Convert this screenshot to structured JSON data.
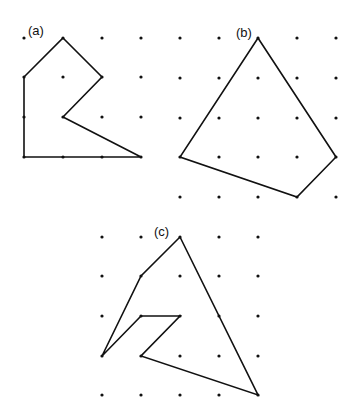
{
  "figures": [
    {
      "label": "(a)",
      "label_pos": [
        28,
        35
      ],
      "grid": {
        "xs": [
          24,
          63,
          102,
          141
        ],
        "ys": [
          38,
          77,
          117,
          157
        ]
      },
      "polygon": [
        [
          63,
          38
        ],
        [
          102,
          77
        ],
        [
          63,
          117
        ],
        [
          141,
          157
        ],
        [
          24,
          157
        ],
        [
          24,
          77
        ]
      ]
    },
    {
      "label": "(b)",
      "label_pos": [
        236,
        37
      ],
      "grid": {
        "xs": [
          180,
          219,
          258,
          297,
          336
        ],
        "ys": [
          38,
          78,
          118,
          157,
          197
        ]
      },
      "polygon": [
        [
          258,
          38
        ],
        [
          336,
          157
        ],
        [
          297,
          197
        ],
        [
          180,
          157
        ]
      ]
    },
    {
      "label": "(c)",
      "label_pos": [
        154,
        236
      ],
      "grid": {
        "xs": [
          102,
          141,
          180,
          219,
          258
        ],
        "ys": [
          237,
          276,
          316,
          356,
          395
        ]
      },
      "polygon": [
        [
          180,
          237
        ],
        [
          258,
          395
        ],
        [
          141,
          356
        ],
        [
          180,
          316
        ],
        [
          141,
          316
        ],
        [
          102,
          356
        ],
        [
          141,
          276
        ]
      ]
    }
  ],
  "colors": {
    "dot": "#111111",
    "line": "#111111",
    "background": "#ffffff"
  }
}
